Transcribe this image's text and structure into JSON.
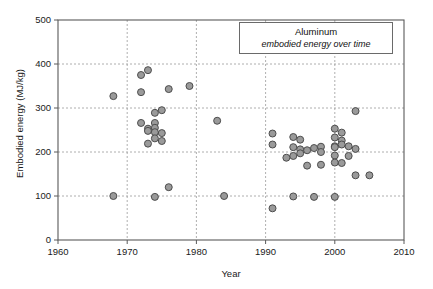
{
  "chart_data": {
    "type": "scatter",
    "title": "Aluminum",
    "subtitle": "embodied energy over time",
    "xlabel": "Year",
    "ylabel": "Embodied energy (MJ/kg)",
    "xlim": [
      1960,
      2010
    ],
    "ylim": [
      0,
      500
    ],
    "xticks": [
      1960,
      1970,
      1980,
      1990,
      2000,
      2010
    ],
    "yticks": [
      0,
      100,
      200,
      300,
      400,
      500
    ],
    "grid": true,
    "legend_position": "top-right",
    "marker": {
      "shape": "circle",
      "fill_color": "#9a9a9a",
      "edge_color": "#4d4d4d",
      "size_px": 7
    },
    "series": [
      {
        "name": "Aluminum embodied energy",
        "points": [
          [
            1968,
            327
          ],
          [
            1968,
            100
          ],
          [
            1972,
            375
          ],
          [
            1972,
            336
          ],
          [
            1973,
            386
          ],
          [
            1972,
            266
          ],
          [
            1973,
            253
          ],
          [
            1973,
            248
          ],
          [
            1973,
            219
          ],
          [
            1974,
            289
          ],
          [
            1974,
            266
          ],
          [
            1974,
            255
          ],
          [
            1974,
            245
          ],
          [
            1974,
            231
          ],
          [
            1974,
            98
          ],
          [
            1975,
            295
          ],
          [
            1975,
            243
          ],
          [
            1975,
            225
          ],
          [
            1976,
            343
          ],
          [
            1976,
            120
          ],
          [
            1979,
            350
          ],
          [
            1983,
            271
          ],
          [
            1984,
            100
          ],
          [
            1991,
            242
          ],
          [
            1991,
            217
          ],
          [
            1991,
            72
          ],
          [
            1993,
            187
          ],
          [
            1994,
            234
          ],
          [
            1994,
            211
          ],
          [
            1994,
            191
          ],
          [
            1994,
            99
          ],
          [
            1995,
            228
          ],
          [
            1995,
            206
          ],
          [
            1995,
            197
          ],
          [
            1996,
            204
          ],
          [
            1996,
            169
          ],
          [
            1997,
            209
          ],
          [
            1997,
            98
          ],
          [
            1998,
            212
          ],
          [
            1998,
            200
          ],
          [
            1998,
            171
          ],
          [
            2000,
            253
          ],
          [
            2000,
            233
          ],
          [
            2000,
            213
          ],
          [
            2000,
            211
          ],
          [
            2000,
            192
          ],
          [
            2000,
            176
          ],
          [
            2000,
            98
          ],
          [
            2001,
            244
          ],
          [
            2001,
            226
          ],
          [
            2001,
            217
          ],
          [
            2001,
            175
          ],
          [
            2002,
            213
          ],
          [
            2002,
            191
          ],
          [
            2003,
            293
          ],
          [
            2003,
            207
          ],
          [
            2003,
            147
          ],
          [
            2005,
            147
          ]
        ]
      }
    ]
  },
  "axes": {
    "left_px": 58,
    "right_px": 404,
    "top_px": 20,
    "bottom_px": 240
  }
}
